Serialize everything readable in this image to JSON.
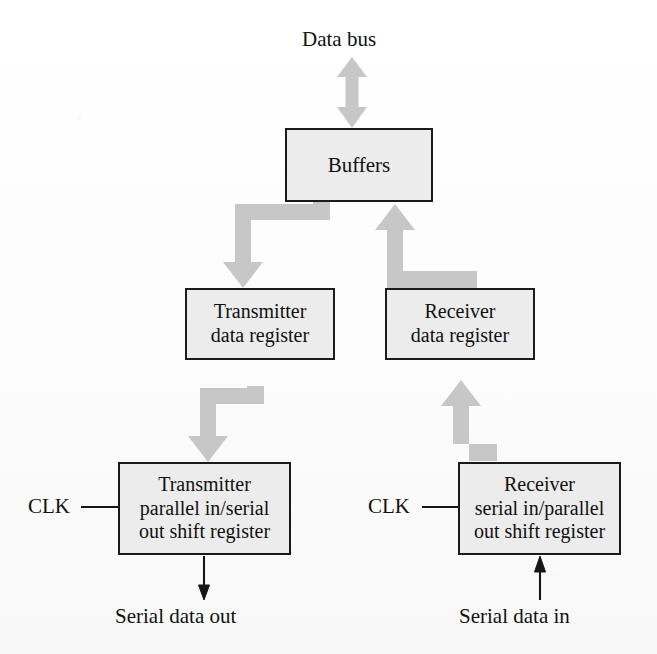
{
  "diagram": {
    "background_color": "#fdfdfd",
    "box_fill_color": "#ececec",
    "box_border_color": "#1a1a1a",
    "thick_arrow_color": "#c6c6c6",
    "thin_arrow_color": "#1a1a1a",
    "top_label": "Data bus",
    "nodes": [
      {
        "id": "buffers",
        "label": "Buffers"
      },
      {
        "id": "transmitter-data-register",
        "label": "Transmitter\ndata register"
      },
      {
        "id": "receiver-data-register",
        "label": "Receiver\ndata register"
      },
      {
        "id": "transmitter-shift-register",
        "label": "Transmitter\nparallel in/serial\nout shift register"
      },
      {
        "id": "receiver-shift-register",
        "label": "Receiver\nserial in/parallel\nout shift register"
      }
    ],
    "clock_labels": {
      "transmitter": "CLK",
      "receiver": "CLK"
    },
    "io_labels": {
      "serial_out": "Serial data out",
      "serial_in": "Serial data in"
    },
    "connections": [
      {
        "from": "data-bus",
        "to": "buffers",
        "style": "double-headed-thick-vertical"
      },
      {
        "from": "buffers",
        "to": "transmitter-data-register",
        "style": "thick-elbow-down-left-down"
      },
      {
        "from": "receiver-data-register",
        "to": "buffers",
        "style": "thick-elbow-up-left-up"
      },
      {
        "from": "transmitter-data-register",
        "to": "transmitter-shift-register",
        "style": "thick-elbow-down-left-down"
      },
      {
        "from": "receiver-shift-register",
        "to": "receiver-data-register",
        "style": "thick-elbow-up-left-up"
      },
      {
        "from": "transmitter-shift-register",
        "to": "serial-data-out",
        "style": "thin-arrow-down"
      },
      {
        "from": "serial-data-in",
        "to": "receiver-shift-register",
        "style": "thin-arrow-up"
      },
      {
        "from": "clk-left",
        "to": "transmitter-shift-register",
        "style": "thin-line"
      },
      {
        "from": "clk-right",
        "to": "receiver-shift-register",
        "style": "thin-line"
      }
    ],
    "caption": ""
  }
}
